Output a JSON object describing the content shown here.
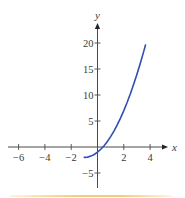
{
  "chart_data": {
    "type": "line",
    "title": "",
    "xlabel": "x",
    "ylabel": "y",
    "xlim": [
      -7,
      5.3
    ],
    "ylim": [
      -7.8,
      24
    ],
    "grid": false,
    "legend": null,
    "x_ticks": [
      -6,
      -4,
      -2,
      2,
      4
    ],
    "x_tick_labels": [
      "−6",
      "−4",
      "−2",
      "2",
      "4"
    ],
    "y_ticks": [
      -5,
      5,
      10,
      15,
      20
    ],
    "y_tick_labels": [
      "−5",
      "5",
      "10",
      "15",
      "20"
    ],
    "axes_style": "cross-at-origin-with-arrows",
    "series": [
      {
        "name": "curve",
        "color": "#2f4fb3",
        "function_approx": "y = x^2 + 2x - 1",
        "x": [
          -1.0,
          -0.75,
          -0.5,
          -0.25,
          0.0,
          0.25,
          0.5,
          0.75,
          1.0,
          1.25,
          1.5,
          1.75,
          2.0,
          2.25,
          2.5,
          2.75,
          3.0,
          3.25,
          3.5,
          3.65
        ],
        "y": [
          -2.0,
          -1.94,
          -1.75,
          -1.44,
          -1.0,
          -0.44,
          0.25,
          1.06,
          2.0,
          3.06,
          4.25,
          5.56,
          7.0,
          8.56,
          10.25,
          12.06,
          14.0,
          16.06,
          18.25,
          19.62
        ]
      }
    ]
  },
  "layout": {
    "origin_px": [
      97.5,
      147
    ],
    "px_per_unit_x": 13.15,
    "px_per_unit_y": 5.2,
    "x_axis_px": [
      8,
      168
    ],
    "y_axis_px": [
      188,
      23
    ]
  },
  "colors": {
    "axis": "#4a4a4a",
    "curve": "#2f4fb3",
    "bottom_rule": "#f0c864"
  },
  "labels": {
    "x_axis": "x",
    "y_axis": "y"
  }
}
